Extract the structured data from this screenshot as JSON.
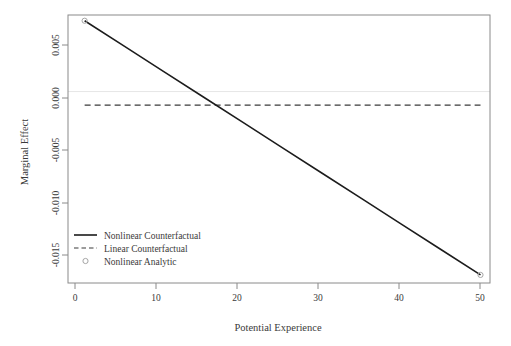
{
  "chart_data": {
    "type": "line",
    "title": "",
    "subtitle": "",
    "xlabel": "Potential Experience",
    "ylabel": "Marginal Effect",
    "xlim": [
      -1.1,
      52.2
    ],
    "ylim": [
      -0.018,
      0.0072
    ],
    "grid": false,
    "xticks": [
      0,
      10,
      20,
      30,
      40,
      50
    ],
    "xtick_labels": [
      "0",
      "10",
      "20",
      "30",
      "40",
      "50"
    ],
    "yticks": [
      0.005,
      0.0,
      -0.005,
      -0.01,
      -0.015
    ],
    "ytick_labels": [
      "0.005",
      "0.000",
      "-0.005",
      "-0.010",
      "-0.015"
    ],
    "legend_position": "lower left (inside plot)",
    "zero_reference_line": 0.0,
    "series": [
      {
        "name": "Nonlinear Counterfactual",
        "style": "solid",
        "color": "#1c1c1c",
        "x": [
          1,
          6,
          11,
          16,
          21,
          26,
          31,
          36,
          41,
          46,
          51
        ],
        "values": [
          0.00666,
          0.00427,
          0.00188,
          -0.00051,
          -0.0029,
          -0.00529,
          -0.00768,
          -0.01007,
          -0.01246,
          -0.01485,
          -0.01724
        ]
      },
      {
        "name": "Linear Counterfactual",
        "style": "dashed",
        "color": "#3a3a3a",
        "x": [
          1,
          51
        ],
        "values": [
          -0.00128,
          -0.00128
        ]
      },
      {
        "name": "Nonlinear Analytic",
        "style": "points",
        "marker": "open-circle",
        "color": "#9a9a9a",
        "x": [
          1,
          51
        ],
        "values": [
          0.00666,
          -0.01724
        ]
      }
    ]
  },
  "legend": {
    "items": [
      {
        "label": "Nonlinear Counterfactual",
        "symbol": "solid-line"
      },
      {
        "label": "Linear Counterfactual",
        "symbol": "dashed-line"
      },
      {
        "label": "Nonlinear Analytic",
        "symbol": "open-circle"
      }
    ]
  },
  "axes": {
    "x_title": "Potential Experience",
    "y_title": "Marginal Effect",
    "x_tick_labels": [
      "0",
      "10",
      "20",
      "30",
      "40",
      "50"
    ],
    "y_tick_labels": [
      "0.005",
      "0.000",
      "-0.005",
      "-0.010",
      "-0.015"
    ]
  },
  "colors": {
    "line": "#1c1c1c",
    "dashed": "#3a3a3a",
    "marker": "#9a9a9a",
    "frame": "#808080",
    "zero_line": "#e2e2e2",
    "text": "#3a3a3a",
    "background": "#ffffff"
  }
}
